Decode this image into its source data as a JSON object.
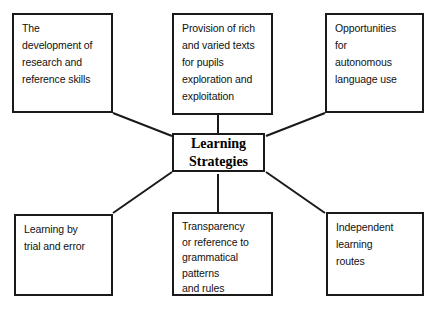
{
  "diagram": {
    "title": "Learning Strategies",
    "type": "radial-concept-map",
    "center": {
      "id": "learning-strategies",
      "label": "Learning\nStrategies",
      "box": {
        "x": 172,
        "y": 133,
        "w": 93,
        "h": 39
      }
    },
    "nodes": [
      {
        "id": "research-reference-skills",
        "label": "The\ndevelopment of\nresearch and\nreference skills",
        "position": "top-left",
        "box": {
          "x": 12,
          "y": 13,
          "w": 101,
          "h": 100
        },
        "tight": false
      },
      {
        "id": "rich-varied-texts",
        "label": "Provision of rich\nand varied texts\nfor pupils\nexploration and\nexploitation",
        "position": "top-center",
        "box": {
          "x": 172,
          "y": 13,
          "w": 101,
          "h": 102
        },
        "tight": false
      },
      {
        "id": "autonomous-language-use",
        "label": "Opportunities\nfor\nautonomous\nlanguage use",
        "position": "top-right",
        "box": {
          "x": 325,
          "y": 13,
          "w": 99,
          "h": 100
        },
        "tight": false
      },
      {
        "id": "trial-and-error",
        "label": "Learning by\ntrial and error",
        "position": "bottom-left",
        "box": {
          "x": 14,
          "y": 214,
          "w": 99,
          "h": 82
        },
        "tight": false
      },
      {
        "id": "grammatical-patterns",
        "label": "Transparency\nor reference to\ngrammatical\npatterns\nand rules",
        "position": "bottom-center",
        "box": {
          "x": 172,
          "y": 212,
          "w": 101,
          "h": 84
        },
        "tight": true
      },
      {
        "id": "independent-learning-routes",
        "label": "Independent\nlearning\nroutes",
        "position": "bottom-right",
        "box": {
          "x": 326,
          "y": 212,
          "w": 98,
          "h": 84
        },
        "tight": false
      }
    ],
    "connectors": [
      {
        "id": "connector-top-left",
        "from": "research-reference-skills",
        "to": "learning-strategies",
        "x1": 113,
        "y1": 113,
        "x2": 172,
        "y2": 136
      },
      {
        "id": "connector-top-center",
        "from": "rich-varied-texts",
        "to": "learning-strategies",
        "x1": 218,
        "y1": 115,
        "x2": 218,
        "y2": 133
      },
      {
        "id": "connector-top-right",
        "from": "autonomous-language-use",
        "to": "learning-strategies",
        "x1": 325,
        "y1": 113,
        "x2": 266,
        "y2": 136
      },
      {
        "id": "connector-bottom-left",
        "from": "trial-and-error",
        "to": "learning-strategies",
        "x1": 113,
        "y1": 213,
        "x2": 172,
        "y2": 172
      },
      {
        "id": "connector-bottom-center",
        "from": "grammatical-patterns",
        "to": "learning-strategies",
        "x1": 218,
        "y1": 212,
        "x2": 218,
        "y2": 174
      },
      {
        "id": "connector-bottom-right",
        "from": "independent-learning-routes",
        "to": "learning-strategies",
        "x1": 325,
        "y1": 213,
        "x2": 266,
        "y2": 172
      }
    ],
    "colors": {
      "stroke": "#1a1a1a",
      "background": "#ffffff",
      "text": "#111111"
    }
  }
}
